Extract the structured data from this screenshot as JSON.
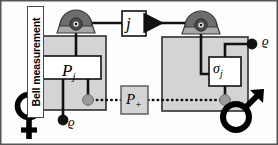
{
  "figure": {
    "type": "diagram",
    "border_color": "#555555",
    "background": "#fdfdfd"
  },
  "colors": {
    "box_fill_gray": "#d4d4d4",
    "inner_box_fill": "#ffffff",
    "detector_dome": "#6d6d6d",
    "detector_base": "#a8a8a8",
    "detector_pupil": "#2b2b2b",
    "node_black": "#111111",
    "node_gray": "#9a9a9a",
    "line_black": "#111111",
    "label_color": "#000000"
  },
  "labels": {
    "bell_measurement": "Bell measurement",
    "p_j": "P",
    "p_j_sub": "j",
    "sigma_j": "σ",
    "sigma_j_sub": "j",
    "channel_j": "j",
    "p_plus": "P",
    "p_plus_sub": "+",
    "rho_left": "ϱ",
    "rho_right": "ϱ",
    "sender_symbol": "♀",
    "receiver_symbol": "♂"
  },
  "elements": {
    "sender_box": {
      "name": "sender-station",
      "fill": "#d4d4d4"
    },
    "receiver_box": {
      "name": "receiver-station",
      "fill": "#d4d4d4"
    },
    "left_detector": {
      "name": "bell-detector",
      "shape": "dome-on-trapezoid"
    },
    "right_detector": {
      "name": "receiver-detector",
      "shape": "dome-on-trapezoid"
    },
    "classical_channel": {
      "name": "classical-channel-arrow",
      "style": "solid-with-arrowhead"
    },
    "entanglement_link": {
      "name": "entanglement-dotted-line",
      "style": "dotted"
    }
  }
}
